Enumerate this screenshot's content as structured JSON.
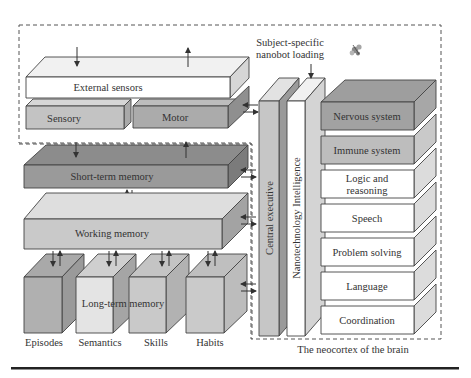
{
  "colors": {
    "white_front": "#ffffff",
    "white_top": "#f3f3f3",
    "white_side": "#d9d9d9",
    "light_front": "#d4d4d4",
    "light_top": "#e3e3e3",
    "light_side": "#bdbdbd",
    "mid_front": "#b4b4b4",
    "mid_top": "#c6c6c6",
    "mid_side": "#9e9e9e",
    "dark_front": "#8f8f8f",
    "dark_top": "#9f9f9f",
    "dark_side": "#7a7a7a",
    "rule": "#222222"
  },
  "senses": {
    "external_sensors": "External sensors",
    "sensory": "Sensory",
    "motor": "Motor"
  },
  "memory": {
    "short_term": "Short-term memory",
    "working": "Working memory",
    "long_term": "Long-term memory",
    "long_term_parts": [
      "Episodes",
      "Semantics",
      "Skills",
      "Habits"
    ]
  },
  "pillars": {
    "central_executive": "Central executive",
    "nanotech_intelligence": "Nanotechnology Intelligence"
  },
  "nanobot": {
    "line1": "Subject-specific",
    "line2": "nanobot loading"
  },
  "neocortex": {
    "caption": "The neocortex of the brain",
    "layers": [
      {
        "label": "Nervous system",
        "lines": [
          "Nervous system"
        ]
      },
      {
        "label": "Immune system",
        "lines": [
          "Immune system"
        ]
      },
      {
        "label": "Logic and reasoning",
        "lines": [
          "Logic and",
          "reasoning"
        ]
      },
      {
        "label": "Speech",
        "lines": [
          "Speech"
        ]
      },
      {
        "label": "Problem solving",
        "lines": [
          "Problem solving"
        ]
      },
      {
        "label": "Language",
        "lines": [
          "Language"
        ]
      },
      {
        "label": "Coordination",
        "lines": [
          "Coordination"
        ]
      }
    ]
  }
}
